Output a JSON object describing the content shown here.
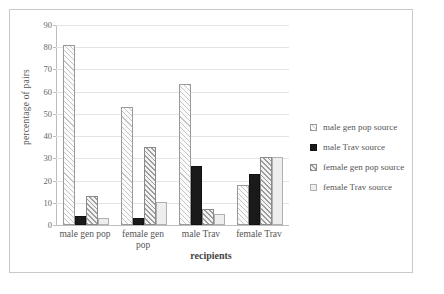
{
  "chart_data": {
    "type": "bar",
    "title": "",
    "xlabel": "recipients",
    "ylabel": "percentage of pairs",
    "ylim": [
      0,
      90
    ],
    "ytick_step": 10,
    "yticks": [
      "90",
      "80",
      "70",
      "60",
      "50",
      "40",
      "30",
      "20",
      "10",
      "0"
    ],
    "grid": true,
    "legend_position": "right",
    "categories": [
      "male gen pop",
      "female gen pop",
      "male Trav",
      "female Trav"
    ],
    "category_lines": [
      [
        "male gen pop"
      ],
      [
        "female gen",
        "pop"
      ],
      [
        "male Trav"
      ],
      [
        "female Trav"
      ]
    ],
    "series": [
      {
        "name": "male gen pop source",
        "fill": "light-diagonal-hatch",
        "values": [
          81,
          53,
          63.5,
          18
        ]
      },
      {
        "name": "male Trav source",
        "fill": "solid-black",
        "values": [
          4,
          3,
          26.5,
          23
        ]
      },
      {
        "name": "female gen pop source",
        "fill": "dark-diagonal-hatch",
        "values": [
          13,
          35,
          7,
          30.5
        ]
      },
      {
        "name": "female Trav source",
        "fill": "solid-light-gray",
        "values": [
          3,
          10.5,
          5,
          30.5
        ]
      }
    ]
  },
  "colors": {
    "frame_border": "#c9c9c9",
    "axis_line": "#bdbdbd",
    "gridline": "#e4e4e4",
    "text": "#555555",
    "series_black": "#1a1a1a",
    "series_light_gray": "#eeeeee",
    "background": "#ffffff"
  }
}
